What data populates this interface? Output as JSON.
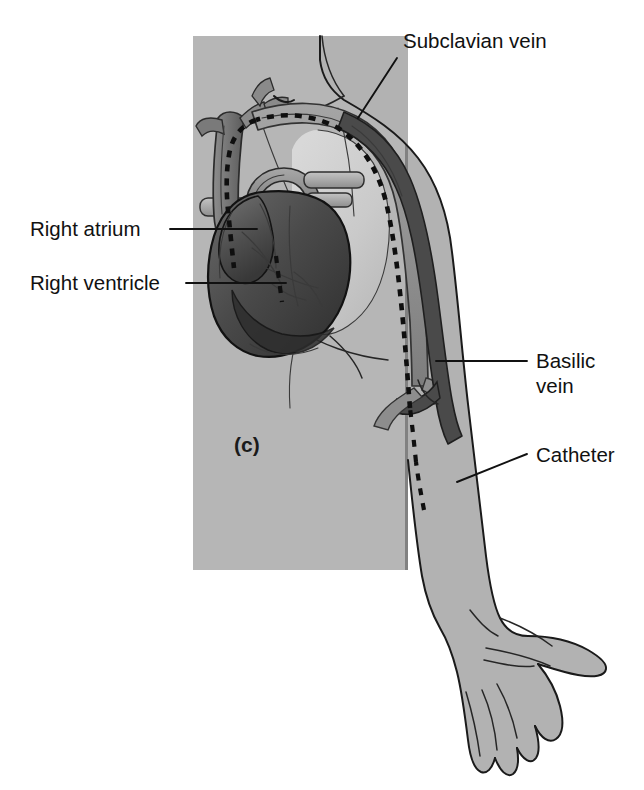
{
  "figure": {
    "part_letter": "(c)",
    "title_caption": "",
    "background_color": "#ffffff"
  },
  "panel": {
    "name": "chest-panel",
    "fill_color": "#b6b6b6",
    "x": 193,
    "y": 36,
    "width": 215,
    "height": 534
  },
  "colors": {
    "skin_gray": "#b2b2b2",
    "panel_gray": "#b6b6b6",
    "torso_gray": "#c2c2c2",
    "vein_light": "#9a9a9a",
    "vein_dark": "#4a4a4a",
    "heart_dark": "#3c3c3c",
    "heart_mid": "#585858",
    "aorta_gray": "#8a8a8a",
    "outline": "#1a1a1a",
    "catheter": "#0f0f0f",
    "text": "#111111"
  },
  "labels": [
    {
      "id": "subclavian-vein",
      "text": "Subclavian vein",
      "text_x": 403,
      "text_y": 48,
      "anchor": "start",
      "leader": "M 397 58 L 358 118"
    },
    {
      "id": "right-atrium",
      "text": "Right atrium",
      "text_x": 30,
      "text_y": 236,
      "anchor": "start",
      "leader": "M 170 229 L 257 229"
    },
    {
      "id": "right-ventricle",
      "text": "Right ventricle",
      "text_x": 30,
      "text_y": 290,
      "anchor": "start",
      "leader": "M 186 283 L 286 283"
    },
    {
      "id": "basilic-vein",
      "text": "Basilic",
      "text_x": 536,
      "text_y": 368,
      "anchor": "start",
      "leader": "M 436 361 L 527 361"
    },
    {
      "id": "basilic-vein-line2",
      "text": "vein",
      "text_x": 536,
      "text_y": 393,
      "anchor": "start",
      "leader": ""
    },
    {
      "id": "catheter",
      "text": "Catheter",
      "text_x": 536,
      "text_y": 462,
      "anchor": "start",
      "leader": "M 457 482 L 527 454"
    }
  ],
  "anatomy": {
    "structures": [
      {
        "name": "chest-panel",
        "description": "gray rectangular chest background panel"
      },
      {
        "name": "torso-shoulder",
        "description": "shoulder and upper chest body outline"
      },
      {
        "name": "lung-shadow",
        "description": "light lung / rib cage silhouette behind heart"
      },
      {
        "name": "heart",
        "description": "heart with right atrium and right ventricle"
      },
      {
        "name": "superior-vena-cava",
        "description": "superior vena cava trunk entering right atrium"
      },
      {
        "name": "aortic-arch",
        "description": "aortic arch above the heart"
      },
      {
        "name": "pulmonary-vessels",
        "description": "pulmonary artery and vessel stubs"
      },
      {
        "name": "subclavian-vein",
        "description": "subclavian vein arcing over the shoulder"
      },
      {
        "name": "basilic-vein",
        "description": "basilic vein running down the medial arm"
      },
      {
        "name": "cephalic-vein",
        "description": "lighter vein branch in the upper arm"
      },
      {
        "name": "arm",
        "description": "right arm extended downward"
      },
      {
        "name": "hand",
        "description": "open hand with fingers and thumb"
      },
      {
        "name": "catheter-line",
        "description": "dashed PICC catheter from forearm to right atrium"
      }
    ],
    "catheter_path_description": "PICC catheter inserted at mid-forearm, travels up the basilic vein, through the axillary and subclavian veins, into the superior vena cava, terminating at the right atrium"
  }
}
